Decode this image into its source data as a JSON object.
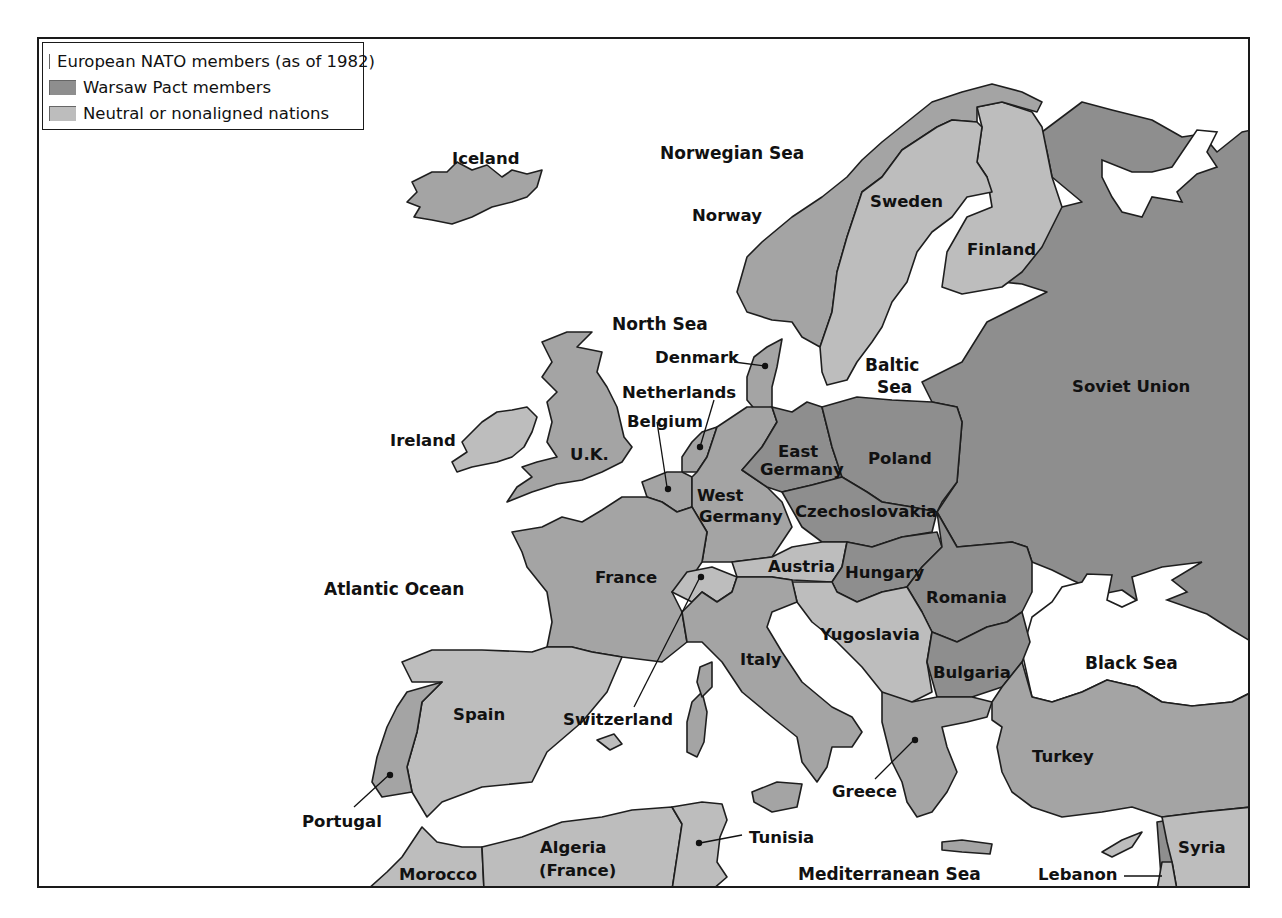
{
  "colors": {
    "nato": "#a4a4a4",
    "warsaw": "#8e8e8e",
    "neutral": "#bdbdbd",
    "water": "#ffffff",
    "border": "#1e1e1e"
  },
  "legend": {
    "items": [
      {
        "key": "nato",
        "label": "European NATO members (as of 1982)"
      },
      {
        "key": "warsaw",
        "label": "Warsaw Pact members"
      },
      {
        "key": "neutral",
        "label": "Neutral or nonaligned nations"
      }
    ]
  },
  "seas": {
    "norwegian": "Norwegian Sea",
    "north": "North Sea",
    "baltic_1": "Baltic",
    "baltic_2": "Sea",
    "atlantic": "Atlantic Ocean",
    "black": "Black Sea",
    "mediterranean": "Mediterranean Sea"
  },
  "countries": {
    "iceland": {
      "label": "Iceland",
      "bloc": "nato"
    },
    "norway": {
      "label": "Norway",
      "bloc": "nato"
    },
    "sweden": {
      "label": "Sweden",
      "bloc": "neutral"
    },
    "finland": {
      "label": "Finland",
      "bloc": "neutral"
    },
    "denmark": {
      "label": "Denmark",
      "bloc": "nato"
    },
    "netherlands": {
      "label": "Netherlands",
      "bloc": "nato"
    },
    "belgium": {
      "label": "Belgium",
      "bloc": "nato"
    },
    "ireland": {
      "label": "Ireland",
      "bloc": "neutral"
    },
    "uk": {
      "label": "U.K.",
      "bloc": "nato"
    },
    "east_germany_1": {
      "label": "East",
      "bloc": "warsaw"
    },
    "east_germany_2": {
      "label": "Germany",
      "bloc": "warsaw"
    },
    "west_germany_1": {
      "label": "West",
      "bloc": "nato"
    },
    "west_germany_2": {
      "label": "Germany",
      "bloc": "nato"
    },
    "poland": {
      "label": "Poland",
      "bloc": "warsaw"
    },
    "czechoslovakia": {
      "label": "Czechoslovakia",
      "bloc": "warsaw"
    },
    "soviet_union": {
      "label": "Soviet Union",
      "bloc": "warsaw"
    },
    "france": {
      "label": "France",
      "bloc": "nato"
    },
    "switzerland": {
      "label": "Switzerland",
      "bloc": "neutral"
    },
    "austria": {
      "label": "Austria",
      "bloc": "neutral"
    },
    "hungary": {
      "label": "Hungary",
      "bloc": "warsaw"
    },
    "romania": {
      "label": "Romania",
      "bloc": "warsaw"
    },
    "yugoslavia": {
      "label": "Yugoslavia",
      "bloc": "neutral"
    },
    "bulgaria": {
      "label": "Bulgaria",
      "bloc": "warsaw"
    },
    "italy": {
      "label": "Italy",
      "bloc": "nato"
    },
    "spain": {
      "label": "Spain",
      "bloc": "neutral"
    },
    "portugal": {
      "label": "Portugal",
      "bloc": "nato"
    },
    "greece": {
      "label": "Greece",
      "bloc": "nato"
    },
    "turkey": {
      "label": "Turkey",
      "bloc": "nato"
    },
    "morocco": {
      "label": "Morocco",
      "bloc": "neutral"
    },
    "algeria_1": {
      "label": "Algeria",
      "bloc": "neutral"
    },
    "algeria_2": {
      "label": "(France)",
      "bloc": "neutral"
    },
    "tunisia": {
      "label": "Tunisia",
      "bloc": "neutral"
    },
    "syria": {
      "label": "Syria",
      "bloc": "neutral"
    },
    "lebanon": {
      "label": "Lebanon",
      "bloc": "neutral"
    }
  }
}
